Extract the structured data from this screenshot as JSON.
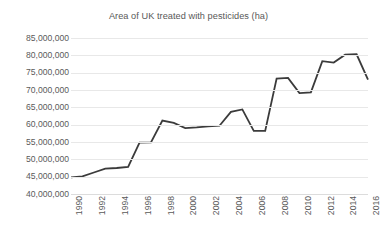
{
  "chart_data": {
    "type": "line",
    "title": "Area of UK treated with pesticides (ha)",
    "xlabel": "",
    "ylabel": "",
    "ylim": [
      40000000,
      85000000
    ],
    "xlim": [
      1990,
      2016
    ],
    "grid": true,
    "legend": false,
    "legend_position": "none",
    "line_color": "#3b3b3b",
    "gridline_color": "#e8e8e8",
    "background_color": "#ffffff",
    "y_ticks": [
      "85,000,000",
      "80,000,000",
      "75,000,000",
      "70,000,000",
      "65,000,000",
      "60,000,000",
      "55,000,000",
      "50,000,000",
      "45,000,000",
      "40,000,000"
    ],
    "y_tick_values": [
      85000000,
      80000000,
      75000000,
      70000000,
      65000000,
      60000000,
      55000000,
      50000000,
      45000000,
      40000000
    ],
    "x_ticks": [
      "1990",
      "1992",
      "1994",
      "1996",
      "1998",
      "2000",
      "2002",
      "2004",
      "2006",
      "2008",
      "2010",
      "2012",
      "2014",
      "2016"
    ],
    "x_tick_values": [
      1990,
      1992,
      1994,
      1996,
      1998,
      2000,
      2002,
      2004,
      2006,
      2008,
      2010,
      2012,
      2014,
      2016
    ],
    "x": [
      1990,
      1991,
      1992,
      1993,
      1994,
      1995,
      1996,
      1997,
      1998,
      1999,
      2000,
      2001,
      2002,
      2003,
      2004,
      2005,
      2006,
      2007,
      2008,
      2009,
      2010,
      2011,
      2012,
      2013,
      2014,
      2015,
      2016
    ],
    "series": [
      {
        "name": "Area treated (ha)",
        "values": [
          44800000,
          45100000,
          46200000,
          47300000,
          47500000,
          47800000,
          54800000,
          54900000,
          61200000,
          60500000,
          59000000,
          59200000,
          59500000,
          59700000,
          63700000,
          64400000,
          58200000,
          58200000,
          73300000,
          73500000,
          69100000,
          69300000,
          78300000,
          77900000,
          80200000,
          80300000,
          73000000
        ]
      }
    ]
  }
}
